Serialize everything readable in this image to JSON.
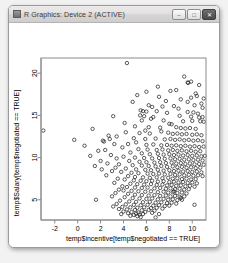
{
  "window": {
    "title": "R Graphics: Device 2 (ACTIVE)",
    "icon": "r-graphics-icon",
    "buttons": {
      "minimize": "–",
      "maximize": "□",
      "close": "✕"
    }
  },
  "chart_data": {
    "type": "scatter",
    "title": "",
    "xlabel": "temp$incentive[temp$negotiated == TRUE]",
    "ylabel": "temp$Salary[temp$negotiated == TRUE]",
    "xticks": [
      -2,
      0,
      2,
      4,
      6,
      8,
      10
    ],
    "yticks": [
      5,
      10,
      15,
      20
    ],
    "xlim": [
      -3.2,
      11.2
    ],
    "ylim": [
      2.6,
      21.8
    ],
    "grid": false,
    "legend": null,
    "marker": "open-circle",
    "marker_color": "#1a1a1a",
    "points": [
      [
        4.3,
        21.2
      ],
      [
        9.3,
        19.6
      ],
      [
        9.9,
        19.0
      ],
      [
        9.6,
        18.9
      ],
      [
        9.65,
        18.85
      ],
      [
        8.6,
        18.0
      ],
      [
        10.3,
        17.6
      ],
      [
        10.4,
        17.3
      ],
      [
        9.9,
        17.1
      ],
      [
        7.1,
        17.2
      ],
      [
        10.8,
        16.4
      ],
      [
        6.2,
        16.2
      ],
      [
        10.2,
        16.2
      ],
      [
        6.5,
        16.0
      ],
      [
        7.4,
        16.05
      ],
      [
        8.4,
        16.1
      ],
      [
        5.5,
        15.6
      ],
      [
        5.7,
        15.5
      ],
      [
        6.0,
        15.45
      ],
      [
        6.9,
        15.5
      ],
      [
        7.8,
        15.3
      ],
      [
        9.6,
        15.4
      ],
      [
        10.1,
        15.35
      ],
      [
        10.5,
        15.2
      ],
      [
        5.45,
        15.0
      ],
      [
        5.8,
        14.9
      ],
      [
        6.6,
        14.8
      ],
      [
        8.9,
        14.95
      ],
      [
        9.9,
        14.85
      ],
      [
        10.6,
        14.75
      ],
      [
        10.9,
        14.8
      ],
      [
        3.1,
        14.9
      ],
      [
        5.6,
        14.4
      ],
      [
        7.5,
        14.4
      ],
      [
        9.2,
        14.3
      ],
      [
        10.0,
        14.35
      ],
      [
        10.7,
        14.3
      ],
      [
        11.0,
        14.25
      ],
      [
        8.0,
        14.0
      ],
      [
        8.2,
        13.95
      ],
      [
        5.0,
        13.7
      ],
      [
        6.2,
        13.6
      ],
      [
        7.2,
        13.55
      ],
      [
        8.6,
        13.6
      ],
      [
        9.0,
        13.5
      ],
      [
        9.4,
        13.45
      ],
      [
        9.8,
        13.5
      ],
      [
        10.3,
        13.4
      ],
      [
        1.3,
        13.4
      ],
      [
        -3.0,
        13.2
      ],
      [
        4.2,
        13.0
      ],
      [
        5.4,
        12.9
      ],
      [
        6.3,
        12.85
      ],
      [
        7.9,
        12.95
      ],
      [
        8.3,
        12.8
      ],
      [
        8.7,
        12.85
      ],
      [
        9.1,
        12.75
      ],
      [
        9.5,
        12.8
      ],
      [
        10.0,
        12.7
      ],
      [
        10.4,
        12.75
      ],
      [
        10.8,
        12.65
      ],
      [
        2.7,
        12.6
      ],
      [
        3.4,
        12.5
      ],
      [
        4.9,
        12.3
      ],
      [
        5.9,
        12.2
      ],
      [
        6.8,
        12.25
      ],
      [
        7.6,
        12.15
      ],
      [
        8.1,
        12.2
      ],
      [
        8.5,
        12.1
      ],
      [
        8.9,
        12.15
      ],
      [
        9.3,
        12.05
      ],
      [
        9.7,
        12.1
      ],
      [
        10.1,
        12.0
      ],
      [
        10.5,
        12.05
      ],
      [
        10.9,
        11.95
      ],
      [
        2.2,
        12.0
      ],
      [
        5.1,
        11.8
      ],
      [
        4.4,
        11.6
      ],
      [
        6.0,
        11.5
      ],
      [
        6.6,
        11.55
      ],
      [
        7.3,
        11.45
      ],
      [
        7.8,
        11.5
      ],
      [
        8.2,
        11.4
      ],
      [
        8.6,
        11.45
      ],
      [
        9.0,
        11.35
      ],
      [
        9.4,
        11.4
      ],
      [
        9.8,
        11.3
      ],
      [
        10.2,
        11.35
      ],
      [
        10.6,
        11.25
      ],
      [
        11.0,
        11.3
      ],
      [
        3.9,
        11.2
      ],
      [
        5.3,
        11.0
      ],
      [
        6.1,
        10.95
      ],
      [
        6.9,
        10.9
      ],
      [
        7.4,
        10.95
      ],
      [
        7.9,
        10.85
      ],
      [
        8.3,
        10.9
      ],
      [
        8.7,
        10.8
      ],
      [
        9.1,
        10.85
      ],
      [
        9.5,
        10.75
      ],
      [
        9.9,
        10.8
      ],
      [
        10.3,
        10.7
      ],
      [
        10.7,
        10.75
      ],
      [
        4.6,
        10.6
      ],
      [
        5.6,
        10.5
      ],
      [
        6.3,
        10.4
      ],
      [
        7.0,
        10.45
      ],
      [
        7.5,
        10.35
      ],
      [
        8.0,
        10.4
      ],
      [
        8.4,
        10.3
      ],
      [
        8.8,
        10.35
      ],
      [
        9.2,
        10.25
      ],
      [
        9.6,
        10.3
      ],
      [
        10.0,
        10.2
      ],
      [
        10.4,
        10.25
      ],
      [
        10.8,
        10.15
      ],
      [
        11.1,
        10.2
      ],
      [
        4.0,
        10.1
      ],
      [
        5.0,
        10.0
      ],
      [
        5.8,
        9.95
      ],
      [
        6.5,
        9.9
      ],
      [
        7.1,
        9.95
      ],
      [
        7.6,
        9.85
      ],
      [
        8.1,
        9.9
      ],
      [
        8.5,
        9.8
      ],
      [
        8.9,
        9.85
      ],
      [
        9.3,
        9.75
      ],
      [
        9.7,
        9.8
      ],
      [
        10.1,
        9.7
      ],
      [
        10.5,
        9.75
      ],
      [
        10.9,
        9.65
      ],
      [
        4.5,
        9.6
      ],
      [
        5.4,
        9.5
      ],
      [
        6.0,
        9.45
      ],
      [
        6.7,
        9.4
      ],
      [
        7.2,
        9.45
      ],
      [
        7.7,
        9.35
      ],
      [
        8.2,
        9.4
      ],
      [
        8.6,
        9.3
      ],
      [
        9.0,
        9.35
      ],
      [
        9.4,
        9.25
      ],
      [
        9.8,
        9.3
      ],
      [
        10.2,
        9.2
      ],
      [
        10.6,
        9.25
      ],
      [
        11.0,
        9.15
      ],
      [
        3.6,
        9.2
      ],
      [
        4.8,
        9.1
      ],
      [
        5.6,
        9.05
      ],
      [
        6.2,
        9.0
      ],
      [
        6.8,
        8.95
      ],
      [
        7.3,
        9.0
      ],
      [
        7.8,
        8.9
      ],
      [
        8.3,
        8.95
      ],
      [
        8.7,
        8.85
      ],
      [
        9.1,
        8.9
      ],
      [
        9.5,
        8.8
      ],
      [
        9.9,
        8.85
      ],
      [
        10.3,
        8.75
      ],
      [
        10.7,
        8.8
      ],
      [
        4.2,
        8.7
      ],
      [
        5.1,
        8.6
      ],
      [
        5.9,
        8.55
      ],
      [
        6.4,
        8.5
      ],
      [
        7.0,
        8.55
      ],
      [
        7.5,
        8.45
      ],
      [
        8.0,
        8.5
      ],
      [
        8.4,
        8.4
      ],
      [
        8.8,
        8.45
      ],
      [
        9.2,
        8.35
      ],
      [
        9.6,
        8.4
      ],
      [
        10.0,
        8.3
      ],
      [
        10.4,
        8.35
      ],
      [
        10.8,
        8.25
      ],
      [
        3.8,
        8.3
      ],
      [
        4.7,
        8.2
      ],
      [
        5.3,
        8.15
      ],
      [
        6.1,
        8.1
      ],
      [
        6.6,
        8.05
      ],
      [
        7.1,
        8.1
      ],
      [
        7.6,
        8.0
      ],
      [
        8.1,
        8.05
      ],
      [
        8.5,
        7.95
      ],
      [
        8.9,
        8.0
      ],
      [
        9.3,
        7.9
      ],
      [
        9.7,
        7.95
      ],
      [
        10.1,
        7.85
      ],
      [
        10.5,
        7.9
      ],
      [
        10.9,
        7.8
      ],
      [
        4.4,
        7.8
      ],
      [
        5.0,
        7.7
      ],
      [
        5.7,
        7.65
      ],
      [
        6.3,
        7.6
      ],
      [
        6.9,
        7.65
      ],
      [
        7.4,
        7.55
      ],
      [
        7.9,
        7.6
      ],
      [
        8.3,
        7.5
      ],
      [
        8.7,
        7.55
      ],
      [
        9.1,
        7.45
      ],
      [
        9.5,
        7.5
      ],
      [
        9.9,
        7.4
      ],
      [
        10.3,
        7.45
      ],
      [
        3.5,
        7.5
      ],
      [
        4.1,
        7.4
      ],
      [
        4.9,
        7.3
      ],
      [
        5.5,
        7.25
      ],
      [
        6.0,
        7.2
      ],
      [
        6.5,
        7.25
      ],
      [
        7.0,
        7.15
      ],
      [
        7.5,
        7.2
      ],
      [
        8.0,
        7.1
      ],
      [
        8.4,
        7.15
      ],
      [
        8.8,
        7.05
      ],
      [
        9.2,
        7.1
      ],
      [
        9.6,
        7.0
      ],
      [
        10.0,
        7.05
      ],
      [
        10.4,
        6.95
      ],
      [
        3.2,
        7.0
      ],
      [
        4.6,
        6.9
      ],
      [
        5.2,
        6.85
      ],
      [
        5.8,
        6.8
      ],
      [
        6.4,
        6.85
      ],
      [
        6.9,
        6.75
      ],
      [
        7.4,
        6.8
      ],
      [
        7.8,
        6.7
      ],
      [
        8.2,
        6.75
      ],
      [
        8.6,
        6.65
      ],
      [
        9.0,
        6.7
      ],
      [
        9.4,
        6.6
      ],
      [
        9.8,
        6.65
      ],
      [
        10.2,
        6.55
      ],
      [
        3.9,
        6.6
      ],
      [
        4.3,
        6.5
      ],
      [
        5.0,
        6.45
      ],
      [
        5.6,
        6.4
      ],
      [
        6.1,
        6.45
      ],
      [
        6.7,
        6.35
      ],
      [
        7.2,
        6.4
      ],
      [
        7.7,
        6.3
      ],
      [
        8.1,
        6.35
      ],
      [
        8.5,
        6.25
      ],
      [
        8.9,
        6.3
      ],
      [
        9.3,
        6.2
      ],
      [
        9.7,
        6.25
      ],
      [
        3.6,
        6.2
      ],
      [
        4.0,
        6.1
      ],
      [
        4.7,
        6.05
      ],
      [
        5.3,
        6.0
      ],
      [
        5.9,
        5.95
      ],
      [
        6.4,
        6.0
      ],
      [
        7.0,
        5.9
      ],
      [
        7.5,
        5.95
      ],
      [
        7.9,
        5.85
      ],
      [
        8.3,
        5.9
      ],
      [
        8.7,
        5.8
      ],
      [
        9.1,
        5.85
      ],
      [
        9.5,
        5.75
      ],
      [
        3.3,
        5.8
      ],
      [
        4.4,
        5.7
      ],
      [
        5.0,
        5.6
      ],
      [
        5.6,
        5.55
      ],
      [
        6.2,
        5.5
      ],
      [
        6.7,
        5.55
      ],
      [
        7.2,
        5.45
      ],
      [
        7.7,
        5.5
      ],
      [
        8.1,
        5.4
      ],
      [
        8.5,
        5.45
      ],
      [
        8.9,
        5.35
      ],
      [
        9.3,
        5.4
      ],
      [
        3.0,
        5.4
      ],
      [
        4.1,
        5.3
      ],
      [
        4.8,
        5.2
      ],
      [
        5.4,
        5.15
      ],
      [
        6.0,
        5.1
      ],
      [
        6.5,
        5.15
      ],
      [
        7.0,
        5.05
      ],
      [
        7.5,
        5.1
      ],
      [
        7.9,
        5.0
      ],
      [
        8.3,
        5.05
      ],
      [
        8.7,
        4.95
      ],
      [
        9.1,
        5.0
      ],
      [
        3.7,
        4.9
      ],
      [
        4.5,
        4.8
      ],
      [
        5.1,
        4.75
      ],
      [
        5.7,
        4.7
      ],
      [
        6.3,
        4.75
      ],
      [
        6.8,
        4.65
      ],
      [
        7.3,
        4.7
      ],
      [
        7.8,
        4.6
      ],
      [
        8.2,
        4.65
      ],
      [
        8.6,
        4.55
      ],
      [
        3.4,
        4.5
      ],
      [
        4.2,
        4.45
      ],
      [
        4.9,
        4.4
      ],
      [
        5.5,
        4.35
      ],
      [
        6.1,
        4.4
      ],
      [
        6.6,
        4.3
      ],
      [
        7.1,
        4.35
      ],
      [
        7.6,
        4.25
      ],
      [
        8.0,
        4.3
      ],
      [
        3.1,
        4.2
      ],
      [
        3.9,
        4.15
      ],
      [
        4.6,
        4.1
      ],
      [
        5.2,
        4.05
      ],
      [
        5.8,
        4.1
      ],
      [
        6.4,
        4.0
      ],
      [
        6.9,
        4.05
      ],
      [
        7.4,
        3.95
      ],
      [
        3.6,
        3.9
      ],
      [
        4.3,
        3.85
      ],
      [
        5.0,
        3.8
      ],
      [
        5.6,
        3.75
      ],
      [
        6.2,
        3.8
      ],
      [
        6.7,
        3.7
      ],
      [
        4.0,
        3.6
      ],
      [
        4.7,
        3.55
      ],
      [
        5.3,
        3.5
      ],
      [
        5.9,
        3.55
      ],
      [
        6.5,
        3.45
      ],
      [
        4.4,
        3.4
      ],
      [
        5.1,
        3.35
      ],
      [
        5.7,
        3.3
      ],
      [
        3.8,
        3.3
      ],
      [
        4.9,
        3.2
      ],
      [
        5.4,
        3.25
      ],
      [
        4.6,
        3.1
      ],
      [
        5.2,
        3.05
      ],
      [
        -0.3,
        12.1
      ],
      [
        0.6,
        11.4
      ],
      [
        1.8,
        10.8
      ],
      [
        2.4,
        10.9
      ],
      [
        2.0,
        9.6
      ],
      [
        2.6,
        9.3
      ],
      [
        1.5,
        9.0
      ],
      [
        2.9,
        10.3
      ],
      [
        3.2,
        11.6
      ],
      [
        2.3,
        11.9
      ],
      [
        1.1,
        10.2
      ],
      [
        3.0,
        8.4
      ],
      [
        2.5,
        7.9
      ],
      [
        3.3,
        8.8
      ],
      [
        2.8,
        12.2
      ],
      [
        1.6,
        5.0
      ],
      [
        3.4,
        9.9
      ],
      [
        2.1,
        8.6
      ],
      [
        5.2,
        17.4
      ],
      [
        6.0,
        17.8
      ],
      [
        4.8,
        16.6
      ],
      [
        7.0,
        18.4
      ],
      [
        8.1,
        17.9
      ],
      [
        9.0,
        16.9
      ],
      [
        10.6,
        18.6
      ],
      [
        11.0,
        17.0
      ],
      [
        6.4,
        14.6
      ],
      [
        7.7,
        16.7
      ],
      [
        8.8,
        15.8
      ],
      [
        10.9,
        15.9
      ],
      [
        4.1,
        14.1
      ],
      [
        5.9,
        13.2
      ],
      [
        7.3,
        13.1
      ],
      [
        9.6,
        16.6
      ],
      [
        8.4,
        6.0
      ],
      [
        9.0,
        5.2
      ],
      [
        10.2,
        4.4
      ],
      [
        7.1,
        3.3
      ],
      [
        6.8,
        2.9
      ],
      [
        5.5,
        2.95
      ]
    ]
  }
}
